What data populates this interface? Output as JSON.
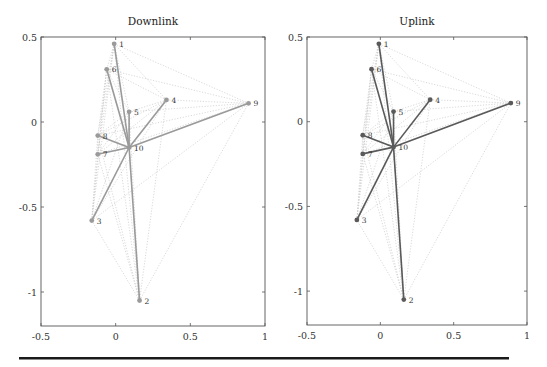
{
  "figure": {
    "panels": [
      {
        "id": "downlink",
        "title": "Downlink",
        "strong_color": "#9a9a9a",
        "strong_width": 1.6
      },
      {
        "id": "uplink",
        "title": "Uplink",
        "strong_color": "#5a5a5a",
        "strong_width": 1.6
      }
    ],
    "x_ticks": [
      "-0.5",
      "0",
      "0.5",
      "1"
    ],
    "y_ticks": [
      "0.5",
      "0",
      "-0.5",
      "-1"
    ]
  },
  "chart_data": {
    "type": "network-graph",
    "xlim": [
      -0.5,
      1.0
    ],
    "ylim": [
      -1.2,
      0.5
    ],
    "x_ticks": [
      -0.5,
      0,
      0.5,
      1
    ],
    "y_ticks": [
      0.5,
      0,
      -0.5,
      -1
    ],
    "grid": false,
    "nodes": [
      {
        "id": "1",
        "x": -0.01,
        "y": 0.46
      },
      {
        "id": "2",
        "x": 0.16,
        "y": -1.05
      },
      {
        "id": "3",
        "x": -0.16,
        "y": -0.58
      },
      {
        "id": "4",
        "x": 0.34,
        "y": 0.13
      },
      {
        "id": "5",
        "x": 0.09,
        "y": 0.06
      },
      {
        "id": "6",
        "x": -0.06,
        "y": 0.31
      },
      {
        "id": "7",
        "x": -0.12,
        "y": -0.19
      },
      {
        "id": "8",
        "x": -0.12,
        "y": -0.08
      },
      {
        "id": "9",
        "x": 0.89,
        "y": 0.11
      },
      {
        "id": "10",
        "x": 0.09,
        "y": -0.15
      }
    ],
    "panels": [
      {
        "title": "Downlink",
        "strong_edges": [
          [
            "10",
            "1"
          ],
          [
            "10",
            "6"
          ],
          [
            "10",
            "5"
          ],
          [
            "10",
            "4"
          ],
          [
            "10",
            "9"
          ],
          [
            "10",
            "8"
          ],
          [
            "10",
            "7"
          ],
          [
            "10",
            "3"
          ],
          [
            "10",
            "2"
          ]
        ]
      },
      {
        "title": "Uplink",
        "strong_edges": [
          [
            "10",
            "1"
          ],
          [
            "10",
            "6"
          ],
          [
            "10",
            "5"
          ],
          [
            "10",
            "4"
          ],
          [
            "10",
            "9"
          ],
          [
            "10",
            "8"
          ],
          [
            "10",
            "7"
          ],
          [
            "10",
            "3"
          ],
          [
            "10",
            "2"
          ]
        ]
      }
    ],
    "weak_edges_dotted": "complete graph among all nodes (light gray dotted)"
  }
}
